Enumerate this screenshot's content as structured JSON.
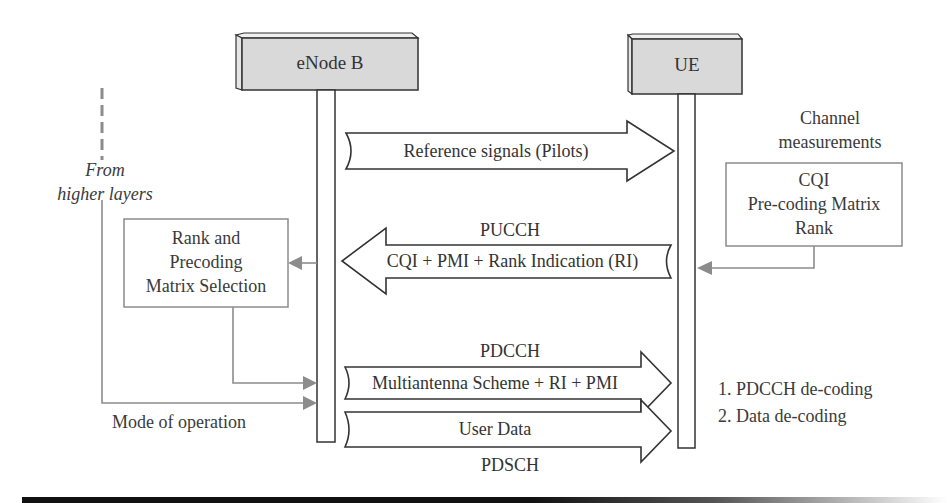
{
  "diagram": {
    "type": "sequence-diagram",
    "nodes": {
      "enodeb": {
        "label": "eNode B"
      },
      "ue": {
        "label": "UE"
      }
    },
    "left_side": {
      "from_label_line1": "From",
      "from_label_line2": "higher layers",
      "selection_box": {
        "line1": "Rank and",
        "line2": "Precoding",
        "line3": "Matrix Selection"
      },
      "mode_label": "Mode of operation"
    },
    "right_side": {
      "measurements_label_line1": "Channel",
      "measurements_label_line2": "measurements",
      "measurements_box": {
        "line1": "CQI",
        "line2": "Pre-coding Matrix",
        "line3": "Rank"
      },
      "steps": [
        "1. PDCCH de-coding",
        "2. Data de-coding"
      ]
    },
    "messages": [
      {
        "id": "pilots",
        "direction": "enodeb-to-ue",
        "text": "Reference signals (Pilots)",
        "channel": ""
      },
      {
        "id": "pucch",
        "direction": "ue-to-enodeb",
        "text": "CQI + PMI + Rank Indication (RI)",
        "channel": "PUCCH"
      },
      {
        "id": "pdcch",
        "direction": "enodeb-to-ue",
        "text": "Multiantenna Scheme + RI + PMI",
        "channel": "PDCCH"
      },
      {
        "id": "pdsch",
        "direction": "enodeb-to-ue",
        "text": "User Data",
        "channel": "PDSCH"
      }
    ],
    "colors": {
      "node_fill": "#d9d9d9",
      "line": "#333333",
      "connector_gray": "#8c8c8c",
      "text": "#333333"
    }
  }
}
